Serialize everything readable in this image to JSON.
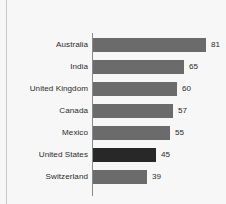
{
  "chart_data": {
    "type": "bar",
    "orientation": "horizontal",
    "title": "",
    "subtitle": "",
    "xlabel": "",
    "ylabel": "",
    "grid": false,
    "legend": false,
    "legend_position": "none",
    "xlim": [
      0,
      81
    ],
    "axis_ticks": [],
    "categories": [
      "Australia",
      "India",
      "United Kingdom",
      "Canada",
      "Mexico",
      "United States",
      "Switzerland"
    ],
    "values": [
      81,
      65,
      60,
      57,
      55,
      45,
      39
    ],
    "value_labels": [
      "81",
      "65",
      "60",
      "57",
      "55",
      "45",
      "39"
    ],
    "highlighted_categories": [
      "United States"
    ],
    "colors": {
      "bar": "#6b6b6b",
      "bar_highlight": "#282828",
      "axis_line": "#8a8a8a",
      "border_rule": "#c9c9c9",
      "background": "#f7f7f7",
      "text": "#2b2b2b"
    }
  }
}
